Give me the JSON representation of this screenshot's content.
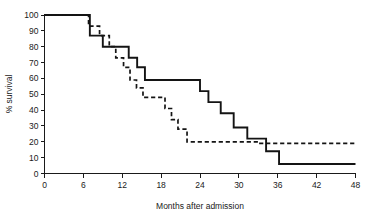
{
  "chart_data": {
    "type": "line",
    "subtype": "kaplan-meier-step",
    "title": "",
    "subtitle": "",
    "xlabel": "Months after admission",
    "ylabel": "% survival",
    "xlim": [
      0,
      48
    ],
    "ylim": [
      0,
      100
    ],
    "xticks": [
      0,
      6,
      12,
      18,
      24,
      30,
      36,
      42,
      48
    ],
    "xtick_labels": [
      "0",
      "6",
      "12",
      "18",
      "24",
      "30",
      "36",
      "42",
      "48"
    ],
    "yticks": [
      0,
      10,
      20,
      30,
      40,
      50,
      60,
      70,
      80,
      90,
      100
    ],
    "ytick_labels": [
      "0",
      "10",
      "20",
      "30",
      "40",
      "50",
      "60",
      "70",
      "80",
      "90",
      "100"
    ],
    "grid": false,
    "legend": false,
    "legend_position": "none",
    "series": [
      {
        "name": "solid-curve",
        "style": "solid",
        "color": "#141414",
        "x": [
          0,
          7.0,
          7.0,
          9.0,
          9.0,
          10.5,
          10.5,
          13.0,
          13.0,
          14.3,
          14.3,
          15.5,
          15.5,
          24.0,
          24.0,
          25.3,
          25.3,
          27.2,
          27.2,
          29.2,
          29.2,
          31.3,
          31.3,
          34.2,
          34.2,
          36.2,
          36.2,
          48.0
        ],
        "y": [
          100,
          100,
          87,
          87,
          80,
          80,
          80,
          80,
          73,
          73,
          67,
          67,
          59,
          59,
          52,
          52,
          45,
          45,
          38,
          38,
          29,
          29,
          22,
          22,
          14,
          14,
          6,
          6
        ]
      },
      {
        "name": "dashed-curve",
        "style": "dashed",
        "color": "#141414",
        "x": [
          0,
          6.8,
          6.8,
          8.5,
          8.5,
          10.0,
          10.0,
          11.0,
          11.0,
          12.2,
          12.2,
          13.2,
          13.2,
          14.2,
          14.2,
          15.2,
          15.2,
          18.6,
          18.6,
          19.6,
          19.6,
          20.6,
          20.6,
          22.0,
          22.0,
          33.0,
          33.0,
          48.0
        ],
        "y": [
          100,
          100,
          93,
          93,
          87,
          87,
          80,
          80,
          73,
          73,
          67,
          67,
          59,
          59,
          54,
          54,
          48,
          48,
          41,
          41,
          34,
          34,
          28,
          28,
          20,
          20,
          19,
          19
        ]
      }
    ]
  }
}
